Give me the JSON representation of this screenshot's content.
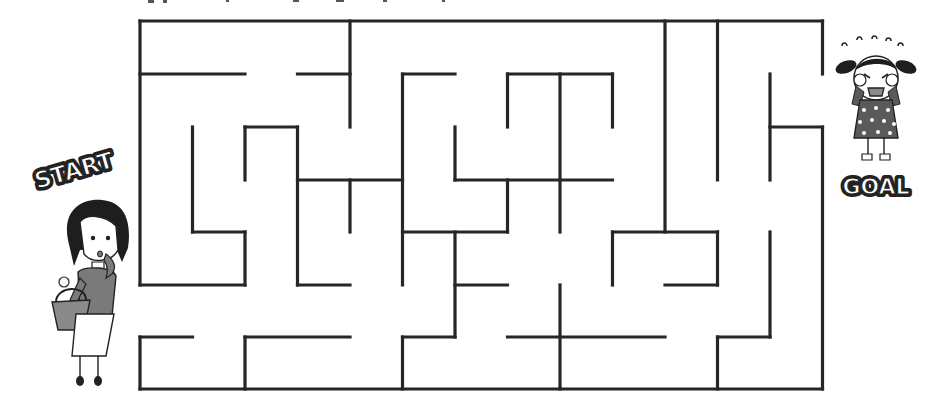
{
  "puzzle": {
    "type": "maze",
    "start_label": "START",
    "goal_label": "GOAL",
    "wall_color": "#262626",
    "background": "#ffffff",
    "grid": {
      "cols_x": [
        140,
        192.5,
        245,
        297.5,
        350,
        402.5,
        455,
        507.5,
        560,
        612.5,
        665,
        717.5,
        770,
        822.5
      ],
      "rows_y": [
        21,
        74,
        127,
        180,
        232,
        285,
        337,
        389
      ]
    },
    "entrance": {
      "side": "left",
      "from_row": 5,
      "to_row": 6
    },
    "exit": {
      "side": "right",
      "from_row": 1,
      "to_row": 2
    },
    "walls": [
      [
        0,
        0,
        13,
        0
      ],
      [
        0,
        0,
        0,
        5
      ],
      [
        0,
        6,
        0,
        7
      ],
      [
        0,
        7,
        13,
        7
      ],
      [
        13,
        0,
        13,
        1
      ],
      [
        13,
        2,
        13,
        7
      ],
      [
        0,
        1,
        2,
        1
      ],
      [
        3,
        1,
        4,
        1
      ],
      [
        4,
        0,
        4,
        2
      ],
      [
        5,
        1,
        6,
        1
      ],
      [
        5,
        1,
        5,
        5
      ],
      [
        7,
        1,
        9,
        1
      ],
      [
        7,
        1,
        7,
        2
      ],
      [
        8,
        1,
        8,
        4
      ],
      [
        9,
        1,
        9,
        2
      ],
      [
        10,
        0,
        10,
        4
      ],
      [
        11,
        0,
        11,
        3
      ],
      [
        12,
        1,
        12,
        3
      ],
      [
        12,
        2,
        13,
        2
      ],
      [
        1,
        2,
        1,
        4
      ],
      [
        1,
        4,
        2,
        4
      ],
      [
        2,
        4,
        2,
        5
      ],
      [
        0,
        5,
        2,
        5
      ],
      [
        2,
        2,
        3,
        2
      ],
      [
        2,
        2,
        2,
        3
      ],
      [
        3,
        2,
        3,
        5
      ],
      [
        3,
        3,
        5,
        3
      ],
      [
        4,
        3,
        4,
        4
      ],
      [
        3,
        5,
        4,
        5
      ],
      [
        6,
        2,
        6,
        3
      ],
      [
        6,
        3,
        9,
        3
      ],
      [
        7,
        3,
        7,
        4
      ],
      [
        5,
        4,
        7,
        4
      ],
      [
        6,
        4,
        6,
        6
      ],
      [
        6,
        5,
        7,
        5
      ],
      [
        5,
        6,
        6,
        6
      ],
      [
        5,
        6,
        5,
        7
      ],
      [
        7,
        6,
        10,
        6
      ],
      [
        8,
        5,
        8,
        7
      ],
      [
        9,
        4,
        11,
        4
      ],
      [
        9,
        4,
        9,
        5
      ],
      [
        11,
        4,
        11,
        5
      ],
      [
        10,
        5,
        11,
        5
      ],
      [
        12,
        4,
        12,
        6
      ],
      [
        11,
        6,
        12,
        6
      ],
      [
        11,
        6,
        11,
        7
      ],
      [
        0,
        6,
        1,
        6
      ],
      [
        2,
        6,
        4,
        6
      ],
      [
        2,
        6,
        2,
        7
      ]
    ]
  },
  "characters": {
    "start_character": "woman-with-basket",
    "goal_character": "crying-girl"
  }
}
